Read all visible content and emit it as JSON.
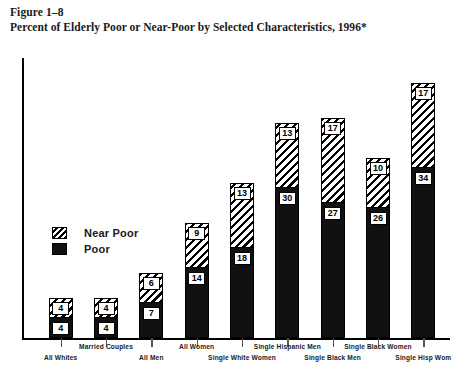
{
  "figure": {
    "number": "Figure 1–8",
    "title": "Percent of Elderly Poor or Near-Poor by Selected Characteristics, 1996*"
  },
  "legend": {
    "position": "inside-upper-left",
    "items": [
      {
        "label": "Near Poor",
        "swatch": "diagonal-hatch",
        "color": "#000000"
      },
      {
        "label": "Poor",
        "swatch": "solid-black",
        "color": "#111111"
      }
    ]
  },
  "chart_data": {
    "type": "bar",
    "stacked": true,
    "title": "Percent of Elderly Poor or Near-Poor by Selected Characteristics, 1996*",
    "xlabel": "",
    "ylabel": "",
    "ylim": [
      0,
      56
    ],
    "grid": false,
    "axis_ticks_labeled": false,
    "categories": [
      "All Whites",
      "Married Couples",
      "All Men",
      "All Women",
      "Single White Women",
      "Single Hispanic Men",
      "Single Black Men",
      "Single Black Women",
      "Single Hisp Wom"
    ],
    "series": [
      {
        "name": "Poor",
        "values": [
          4,
          4,
          7,
          14,
          18,
          30,
          27,
          26,
          34
        ]
      },
      {
        "name": "Near Poor",
        "values": [
          4,
          4,
          6,
          9,
          13,
          13,
          17,
          10,
          17
        ]
      }
    ],
    "totals": [
      8,
      8,
      13,
      23,
      31,
      43,
      44,
      36,
      51
    ]
  }
}
